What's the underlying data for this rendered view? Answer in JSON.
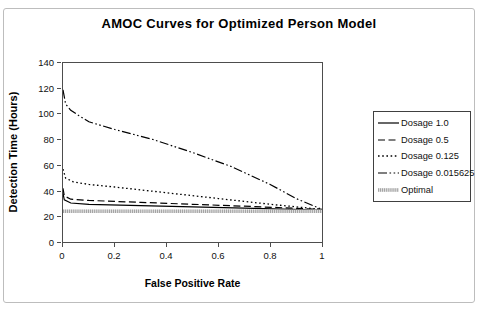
{
  "accent_colors": {
    "line": "#000000",
    "axis": "#4d4d4d",
    "frame_border": "#bdbdbd",
    "optimal_fill": "#dedede",
    "optimal_stripe": "#8c8c8c",
    "background": "#ffffff"
  },
  "chart_data": {
    "type": "line",
    "title": "AMOC Curves for Optimized Person Model",
    "xlabel": "False Positive Rate",
    "ylabel": "Detection Time (Hours)",
    "xlim": [
      0,
      1
    ],
    "ylim": [
      0,
      140
    ],
    "grid": false,
    "legend_position": "right",
    "x_ticks": [
      {
        "label": "0",
        "value": 0
      },
      {
        "label": "0.2",
        "value": 0.2
      },
      {
        "label": "0.4",
        "value": 0.4
      },
      {
        "label": "0.6",
        "value": 0.6
      },
      {
        "label": "0.8",
        "value": 0.8
      },
      {
        "label": "1",
        "value": 1
      }
    ],
    "y_ticks": [
      {
        "label": "0",
        "value": 0
      },
      {
        "label": "20",
        "value": 20
      },
      {
        "label": "40",
        "value": 40
      },
      {
        "label": "60",
        "value": 60
      },
      {
        "label": "80",
        "value": 80
      },
      {
        "label": "100",
        "value": 100
      },
      {
        "label": "120",
        "value": 120
      },
      {
        "label": "140",
        "value": 140
      }
    ],
    "series": [
      {
        "name": "Dosage 1.0",
        "style": "solid",
        "points": [
          [
            0,
            38
          ],
          [
            0.005,
            33
          ],
          [
            0.03,
            30.5
          ],
          [
            0.1,
            29.5
          ],
          [
            0.3,
            28.5
          ],
          [
            0.5,
            27.5
          ],
          [
            0.7,
            26.5
          ],
          [
            1,
            25
          ]
        ]
      },
      {
        "name": "Dosage 0.5",
        "style": "dashed",
        "points": [
          [
            0,
            42
          ],
          [
            0.005,
            36
          ],
          [
            0.03,
            33.5
          ],
          [
            0.1,
            32.5
          ],
          [
            0.3,
            31
          ],
          [
            0.5,
            29.5
          ],
          [
            0.7,
            28
          ],
          [
            1,
            25.5
          ]
        ]
      },
      {
        "name": "Dosage 0.125",
        "style": "dotted",
        "points": [
          [
            0,
            57
          ],
          [
            0.01,
            50
          ],
          [
            0.04,
            47
          ],
          [
            0.1,
            45
          ],
          [
            0.2,
            43
          ],
          [
            0.4,
            38.5
          ],
          [
            0.6,
            34
          ],
          [
            0.8,
            29.5
          ],
          [
            1,
            25.5
          ]
        ]
      },
      {
        "name": "Dosage 0.015625",
        "style": "dashdotdot",
        "points": [
          [
            0,
            119
          ],
          [
            0.01,
            108
          ],
          [
            0.03,
            103
          ],
          [
            0.06,
            99
          ],
          [
            0.1,
            94
          ],
          [
            0.2,
            88
          ],
          [
            0.35,
            80
          ],
          [
            0.5,
            70
          ],
          [
            0.65,
            59
          ],
          [
            0.8,
            45
          ],
          [
            0.9,
            34
          ],
          [
            1,
            25.5
          ]
        ]
      },
      {
        "name": "Optimal",
        "style": "textured",
        "points": [
          [
            0,
            24
          ],
          [
            1,
            24
          ]
        ]
      }
    ]
  }
}
